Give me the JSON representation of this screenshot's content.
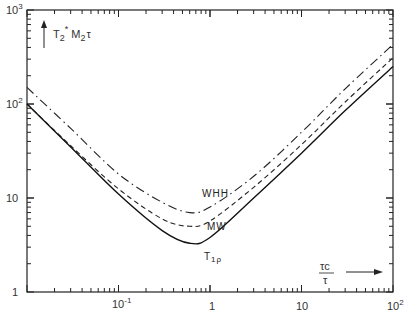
{
  "chart_data": {
    "type": "line",
    "title": "",
    "xlabel": "τc/τ",
    "ylabel": "T2* M2 τ",
    "xscale": "log",
    "yscale": "log",
    "xlim": [
      0.01,
      100
    ],
    "ylim": [
      1,
      1000
    ],
    "x_tick_labels": [
      "10^-1",
      "1",
      "10",
      "10^2"
    ],
    "y_tick_labels": [
      "1",
      "10",
      "10^2",
      "10^3"
    ],
    "grid": false,
    "legend": "inline labels",
    "x": [
      0.01,
      0.03,
      0.1,
      0.3,
      0.6,
      1,
      3,
      10,
      30,
      100
    ],
    "series": [
      {
        "name": "T1ρ",
        "style": "solid",
        "values": [
          100,
          35,
          11,
          4.5,
          3.3,
          3.8,
          10,
          30,
          85,
          250
        ]
      },
      {
        "name": "MW",
        "style": "dashed",
        "values": [
          100,
          36,
          12.5,
          6,
          5,
          5.7,
          13,
          37,
          105,
          310
        ]
      },
      {
        "name": "WHH",
        "style": "dash-dot",
        "values": [
          150,
          55,
          18,
          9,
          7,
          8,
          17,
          50,
          145,
          430
        ]
      }
    ]
  },
  "labels": {
    "y_axis_main": "T",
    "y_axis_sub": "2",
    "y_axis_sup": "*",
    "y_axis_rest": "M",
    "y_axis_rest_sub": "2",
    "y_axis_tail": "τ",
    "x_axis_num": "τc",
    "x_axis_den": "τ",
    "curve_whh": "WHH",
    "curve_mw": "MW",
    "curve_t1p": "T",
    "curve_t1p_sub": "1ρ",
    "ytick_1": "1",
    "ytick_10": "10",
    "ytick_100_base": "10",
    "ytick_100_exp": "2",
    "ytick_1000_base": "10",
    "ytick_1000_exp": "3",
    "xtick_01_base": "10",
    "xtick_01_exp": "-1",
    "xtick_1": "1",
    "xtick_10": "10",
    "xtick_100_base": "10",
    "xtick_100_exp": "2"
  }
}
